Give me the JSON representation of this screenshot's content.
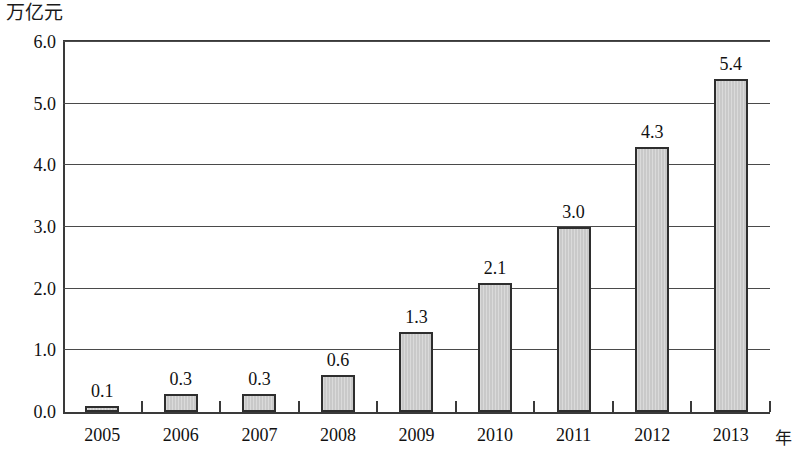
{
  "chart_data": {
    "type": "bar",
    "title": "",
    "subtitle": "",
    "ylabel": "万亿元",
    "xlabel": "年",
    "categories": [
      "2005",
      "2006",
      "2007",
      "2008",
      "2009",
      "2010",
      "2011",
      "2012",
      "2013"
    ],
    "values": [
      0.1,
      0.3,
      0.3,
      0.6,
      1.3,
      2.1,
      3.0,
      4.3,
      5.4
    ],
    "data_labels": [
      "0.1",
      "0.3",
      "0.3",
      "0.6",
      "1.3",
      "2.1",
      "3.0",
      "4.3",
      "5.4"
    ],
    "ylim": [
      0.0,
      6.0
    ],
    "y_ticks": [
      0.0,
      1.0,
      2.0,
      3.0,
      4.0,
      5.0,
      6.0
    ],
    "y_tick_labels": [
      "0.0",
      "1.0",
      "2.0",
      "3.0",
      "4.0",
      "5.0",
      "6.0"
    ],
    "grid": true,
    "grid_axis": "y",
    "legend": false,
    "legend_position": "none",
    "bar_fill_color": "#c9c9c9",
    "bar_border_color": "#2e2e2e",
    "axis_color": "#3a3a3a",
    "grid_color": "#4a4a4a",
    "text_color": "#111111",
    "background_color": "#ffffff"
  }
}
